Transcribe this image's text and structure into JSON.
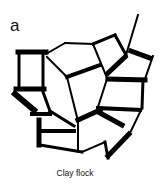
{
  "figure": {
    "panel_label": "a",
    "caption": "Clay flock",
    "stroke_color": "#000000",
    "background_color": "#ffffff",
    "segments": [
      {
        "x1": 18,
        "y1": 52,
        "x2": 46,
        "y2": 52,
        "w": 5
      },
      {
        "x1": 19,
        "y1": 52,
        "x2": 19,
        "y2": 89,
        "w": 3
      },
      {
        "x1": 43,
        "y1": 52,
        "x2": 43,
        "y2": 89,
        "w": 3
      },
      {
        "x1": 16,
        "y1": 89,
        "x2": 44,
        "y2": 89,
        "w": 5
      },
      {
        "x1": 46,
        "y1": 54,
        "x2": 65,
        "y2": 43,
        "w": 2
      },
      {
        "x1": 65,
        "y1": 43,
        "x2": 93,
        "y2": 44,
        "w": 2
      },
      {
        "x1": 93,
        "y1": 44,
        "x2": 115,
        "y2": 35,
        "w": 3
      },
      {
        "x1": 115,
        "y1": 35,
        "x2": 126,
        "y2": 55,
        "w": 3
      },
      {
        "x1": 126,
        "y1": 55,
        "x2": 138,
        "y2": 15,
        "w": 2
      },
      {
        "x1": 131,
        "y1": 51,
        "x2": 150,
        "y2": 58,
        "w": 5
      },
      {
        "x1": 153,
        "y1": 56,
        "x2": 145,
        "y2": 79,
        "w": 2
      },
      {
        "x1": 108,
        "y1": 79,
        "x2": 145,
        "y2": 80,
        "w": 5
      },
      {
        "x1": 108,
        "y1": 73,
        "x2": 125,
        "y2": 57,
        "w": 5
      },
      {
        "x1": 93,
        "y1": 44,
        "x2": 107,
        "y2": 78,
        "w": 2
      },
      {
        "x1": 67,
        "y1": 77,
        "x2": 100,
        "y2": 65,
        "w": 4
      },
      {
        "x1": 47,
        "y1": 57,
        "x2": 67,
        "y2": 77,
        "w": 2
      },
      {
        "x1": 67,
        "y1": 77,
        "x2": 78,
        "y2": 121,
        "w": 2
      },
      {
        "x1": 143,
        "y1": 80,
        "x2": 142,
        "y2": 108,
        "w": 3
      },
      {
        "x1": 98,
        "y1": 108,
        "x2": 140,
        "y2": 110,
        "w": 4
      },
      {
        "x1": 107,
        "y1": 79,
        "x2": 97,
        "y2": 110,
        "w": 2
      },
      {
        "x1": 78,
        "y1": 120,
        "x2": 100,
        "y2": 110,
        "w": 5
      },
      {
        "x1": 100,
        "y1": 113,
        "x2": 122,
        "y2": 125,
        "w": 5
      },
      {
        "x1": 142,
        "y1": 108,
        "x2": 130,
        "y2": 133,
        "w": 2
      },
      {
        "x1": 129,
        "y1": 134,
        "x2": 108,
        "y2": 156,
        "w": 5
      },
      {
        "x1": 108,
        "y1": 158,
        "x2": 105,
        "y2": 142,
        "w": 3
      },
      {
        "x1": 105,
        "y1": 142,
        "x2": 82,
        "y2": 152,
        "w": 2
      },
      {
        "x1": 82,
        "y1": 152,
        "x2": 40,
        "y2": 145,
        "w": 3
      },
      {
        "x1": 39,
        "y1": 120,
        "x2": 39,
        "y2": 145,
        "w": 5
      },
      {
        "x1": 40,
        "y1": 131,
        "x2": 74,
        "y2": 131,
        "w": 4
      },
      {
        "x1": 78,
        "y1": 121,
        "x2": 78,
        "y2": 152,
        "w": 2
      },
      {
        "x1": 43,
        "y1": 92,
        "x2": 50,
        "y2": 111,
        "w": 3
      },
      {
        "x1": 50,
        "y1": 111,
        "x2": 74,
        "y2": 126,
        "w": 3
      },
      {
        "x1": 15,
        "y1": 94,
        "x2": 34,
        "y2": 110,
        "w": 6
      },
      {
        "x1": 32,
        "y1": 114,
        "x2": 50,
        "y2": 114,
        "w": 4
      }
    ]
  }
}
